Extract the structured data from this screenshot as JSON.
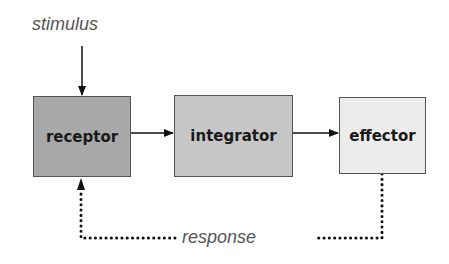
{
  "diagram": {
    "input_label": "stimulus",
    "feedback_label": "response",
    "nodes": [
      {
        "id": "receptor",
        "label": "receptor",
        "fill": "#a8a8a8"
      },
      {
        "id": "integrator",
        "label": "integrator",
        "fill": "#c6c6c6"
      },
      {
        "id": "effector",
        "label": "effector",
        "fill": "#ececec"
      }
    ],
    "edges": [
      {
        "from": "stimulus",
        "to": "receptor",
        "style": "solid"
      },
      {
        "from": "receptor",
        "to": "integrator",
        "style": "solid"
      },
      {
        "from": "integrator",
        "to": "effector",
        "style": "solid"
      },
      {
        "from": "effector",
        "to": "receptor",
        "style": "dotted",
        "label": "response"
      }
    ]
  }
}
